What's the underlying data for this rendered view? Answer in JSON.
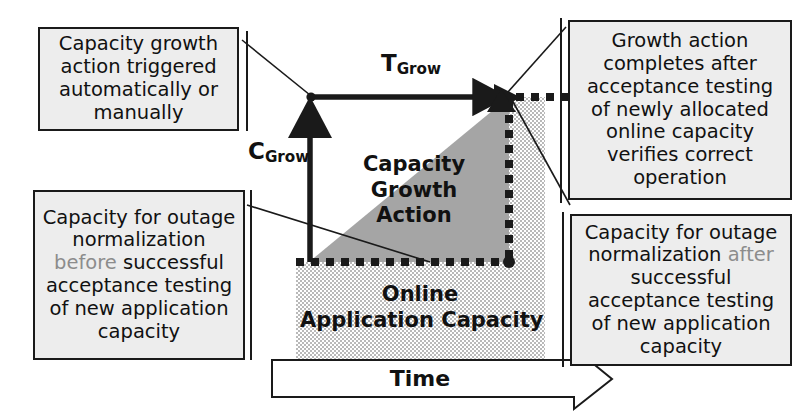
{
  "diagram": {
    "title_present": false,
    "callouts": {
      "top_left": {
        "name": "capacity-growth-trigger-note",
        "lines": [
          "Capacity growth",
          "action  triggered",
          "automatically or",
          "manually"
        ]
      },
      "top_right": {
        "name": "growth-action-completion-note",
        "lines": [
          "Growth action",
          "completes after",
          "acceptance testing",
          "of newly allocated",
          "online capacity",
          "verifies correct",
          "operation"
        ]
      },
      "bottom_left": {
        "name": "outage-normalization-before-note",
        "text_pre": "Capacity for outage normalization ",
        "emphasis": "before",
        "text_post": " successful acceptance testing of new application capacity"
      },
      "bottom_right": {
        "name": "outage-normalization-after-note",
        "text_pre": "Capacity for outage normalization ",
        "emphasis": "after",
        "text_post": " successful acceptance testing of new application capacity"
      }
    },
    "chart_labels": {
      "t_grow_base": "T",
      "t_grow_sub": "Grow",
      "c_grow_base": "C",
      "c_grow_sub": "Grow",
      "growth_region_lines": [
        "Capacity",
        "Growth",
        "Action"
      ],
      "online_region_lines": [
        "Online",
        "Application Capacity"
      ],
      "time_axis": "Time"
    },
    "colors": {
      "callout_fill": "#ededed",
      "stroke": "#1a1a1a",
      "growth_triangle_fill": "#a5a5a5",
      "online_capacity_fill": "#c9c9c9",
      "emphasis_text": "#8c8c8c",
      "page_background": "#ffffff"
    }
  }
}
